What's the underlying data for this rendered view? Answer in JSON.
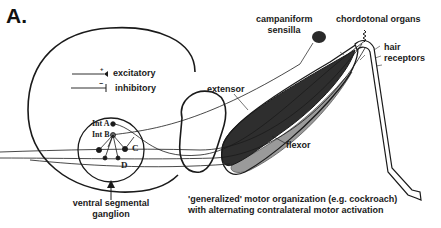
{
  "figure": {
    "panel_label": "A.",
    "legend": {
      "excitatory": {
        "symbol": "+",
        "label": "excitatory"
      },
      "inhibitory": {
        "symbol": "−",
        "label": "inhibitory"
      }
    },
    "neurons": {
      "int_a": "Int A",
      "int_b": "Int B",
      "c": "C",
      "d": "D"
    },
    "labels": {
      "ganglion_line1": "ventral segmental",
      "ganglion_line2": "ganglion",
      "extensor": "extensor",
      "flexor": "flexor",
      "campaniform_line1": "campaniform",
      "campaniform_line2": "sensilla",
      "chordotonal": "chordotonal organs",
      "hair_line1": "hair",
      "hair_line2": "receptors"
    },
    "caption": {
      "line1": "'generalized' motor organization (e.g. cockroach)",
      "line2": "with alternating contralateral motor activation"
    },
    "colors": {
      "extensor_fill": "#2e2e2e",
      "flexor_fill": "#9a9a9a",
      "line": "#1a1a1a"
    }
  }
}
